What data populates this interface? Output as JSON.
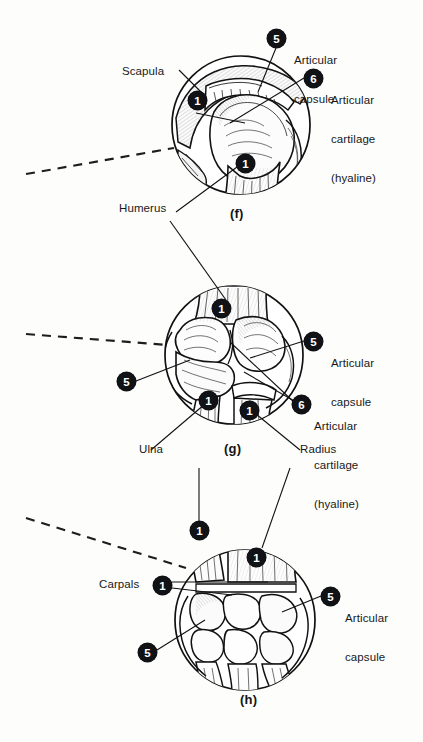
{
  "figure": {
    "background_color": "#fdfdfc",
    "ink_color": "#17181a",
    "badge_background": "#111215",
    "badge_text_color": "#ffffff"
  },
  "panels": [
    {
      "id": "f",
      "caption": "(f)",
      "joint": "shoulder",
      "labels": [
        {
          "name": "scapula",
          "text": "Scapula"
        },
        {
          "name": "humerus",
          "text": "Humerus"
        },
        {
          "name": "articular-capsule",
          "text": "Articular\ncapsule"
        },
        {
          "name": "articular-cartilage",
          "text": "Articular\ncartilage\n(hyaline)"
        }
      ],
      "badges": [
        {
          "name": "badge-1-scapula",
          "number": "1"
        },
        {
          "name": "badge-1-humerus",
          "number": "1"
        },
        {
          "name": "badge-5-capsule",
          "number": "5"
        },
        {
          "name": "badge-6-cartilage",
          "number": "6"
        }
      ]
    },
    {
      "id": "g",
      "caption": "(g)",
      "joint": "elbow",
      "labels": [
        {
          "name": "ulna",
          "text": "Ulna"
        },
        {
          "name": "radius",
          "text": "Radius"
        },
        {
          "name": "articular-capsule",
          "text": "Articular\ncapsule"
        },
        {
          "name": "articular-cartilage",
          "text": "Articular\ncartilage\n(hyaline)"
        }
      ],
      "badges": [
        {
          "name": "badge-1-humerus",
          "number": "1"
        },
        {
          "name": "badge-5-capsule-left",
          "number": "5"
        },
        {
          "name": "badge-5-capsule-right",
          "number": "5"
        },
        {
          "name": "badge-1-ulna",
          "number": "1"
        },
        {
          "name": "badge-1-radius",
          "number": "1"
        },
        {
          "name": "badge-6-cartilage",
          "number": "6"
        }
      ]
    },
    {
      "id": "h",
      "caption": "(h)",
      "joint": "wrist",
      "labels": [
        {
          "name": "carpals",
          "text": "Carpals"
        },
        {
          "name": "articular-capsule",
          "text": "Articular\ncapsule"
        }
      ],
      "badges": [
        {
          "name": "badge-1-ulna",
          "number": "1"
        },
        {
          "name": "badge-1-radius",
          "number": "1"
        },
        {
          "name": "badge-1-carpals",
          "number": "1"
        },
        {
          "name": "badge-5-capsule-right",
          "number": "5"
        },
        {
          "name": "badge-5-capsule-left",
          "number": "5"
        }
      ]
    }
  ],
  "text": {
    "scapula": "Scapula",
    "humerus": "Humerus",
    "ulna": "Ulna",
    "radius": "Radius",
    "carpals": "Carpals",
    "articular_capsule_l1": "Articular",
    "articular_capsule_l2": "capsule",
    "articular_cartilage_l1": "Articular",
    "articular_cartilage_l2": "cartilage",
    "articular_cartilage_l3": "(hyaline)",
    "caption_f": "(f)",
    "caption_g": "(g)",
    "caption_h": "(h)",
    "n1": "1",
    "n5": "5",
    "n6": "6"
  }
}
